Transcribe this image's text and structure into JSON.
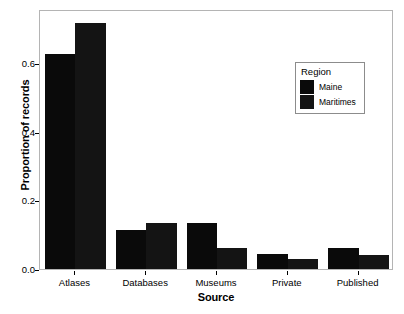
{
  "chart_data": {
    "type": "bar",
    "title": "",
    "xlabel": "Source",
    "ylabel": "Proportion of records",
    "categories": [
      "Atlases",
      "Databases",
      "Museums",
      "Private",
      "Published"
    ],
    "series": [
      {
        "name": "Maine",
        "values": [
          0.625,
          0.115,
          0.135,
          0.045,
          0.06
        ]
      },
      {
        "name": "Maritimes",
        "values": [
          0.715,
          0.135,
          0.06,
          0.03,
          0.042
        ]
      }
    ],
    "ylim": [
      0.0,
      0.757
    ],
    "yticks": [
      0.0,
      0.2,
      0.4,
      0.6
    ],
    "ytick_labels": [
      "0.0",
      "0.2",
      "0.4",
      "0.6"
    ],
    "grid": false,
    "legend": {
      "title": "Region",
      "position": "inside-top-right"
    },
    "colors": {
      "Maine": "#0a0a0a",
      "Maritimes": "#141414",
      "panel_border": "#b4b4b4",
      "background": "#ffffff"
    }
  }
}
